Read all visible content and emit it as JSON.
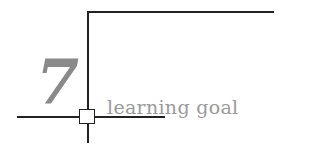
{
  "badge": {
    "number": "7",
    "label": "learning goal"
  },
  "colors": {
    "lines": "#222222",
    "text": "#9a9a9a",
    "number": "#8a8a8a"
  }
}
